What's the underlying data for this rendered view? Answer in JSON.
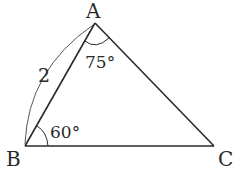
{
  "diagram": {
    "type": "triangle",
    "vertices": {
      "A": {
        "label": "A",
        "x": 95,
        "y": 23
      },
      "B": {
        "label": "B",
        "x": 25,
        "y": 146
      },
      "C": {
        "label": "C",
        "x": 214,
        "y": 146
      }
    },
    "angles": {
      "A": {
        "label": "75°"
      },
      "B": {
        "label": "60°"
      }
    },
    "sides": {
      "AB": {
        "label": "2"
      }
    },
    "colors": {
      "stroke": "#2a2a2a",
      "background": "#ffffff"
    }
  }
}
